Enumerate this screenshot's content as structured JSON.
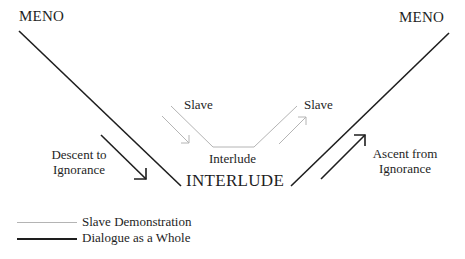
{
  "diagram": {
    "labels": {
      "meno_left": "MENO",
      "meno_right": "MENO",
      "slave_left": "Slave",
      "slave_right": "Slave",
      "interlude_small": "Interlude",
      "interlude_big": "INTERLUDE",
      "descent_line1": "Descent to",
      "descent_line2": "Ignorance",
      "ascent_line1": "Ascent from",
      "ascent_line2": "Ignorance"
    },
    "legend": [
      {
        "label": "Slave Demonstration",
        "style": "thin-gray"
      },
      {
        "label": "Dialogue as a Whole",
        "style": "thick-black"
      }
    ],
    "colors": {
      "main_line": "#1e1e1e",
      "slave_line": "#b4b4b4"
    }
  }
}
